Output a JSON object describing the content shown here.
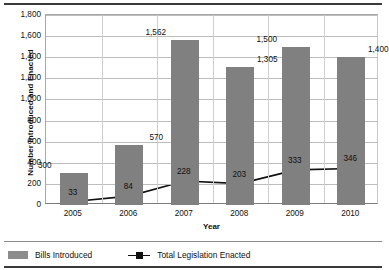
{
  "chart_data": {
    "type": "bar",
    "title": "",
    "xlabel": "Year",
    "ylabel": "Number Introduced and Enacted",
    "categories": [
      "2005",
      "2006",
      "2007",
      "2008",
      "2009",
      "2010"
    ],
    "ylim": [
      0,
      1800
    ],
    "yticks": [
      "0",
      "200",
      "400",
      "600",
      "800",
      "1,000",
      "1,200",
      "1,400",
      "1,600",
      "1,800"
    ],
    "ytick_values": [
      0,
      200,
      400,
      600,
      800,
      1000,
      1200,
      1400,
      1600,
      1800
    ],
    "grid": true,
    "legend_position": "bottom-left",
    "series": [
      {
        "name": "Bills Introduced",
        "type": "bar",
        "color": "#808080",
        "values": [
          300,
          570,
          1562,
          1305,
          1500,
          1400
        ],
        "labels": [
          "300",
          "570",
          "1,562",
          "1,305",
          "1,500",
          "1,400"
        ]
      },
      {
        "name": "Total Legislation Enacted",
        "type": "line",
        "color": "#111111",
        "marker": "square",
        "values": [
          33,
          84,
          228,
          203,
          333,
          346
        ],
        "labels": [
          "33",
          "84",
          "228",
          "203",
          "333",
          "346"
        ]
      }
    ]
  },
  "axes": {
    "y_title": "Number Introduced and Enacted",
    "x_title": "Year"
  },
  "legend": {
    "items": [
      {
        "label": "Bills Introduced",
        "marker": "bar-swatch"
      },
      {
        "label": "Total Legislation Enacted",
        "marker": "line-square-marker"
      }
    ]
  }
}
